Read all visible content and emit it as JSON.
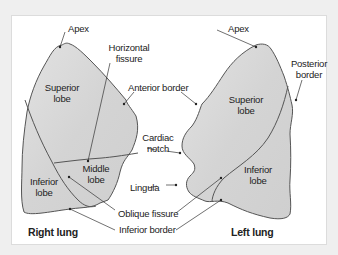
{
  "diagram": {
    "type": "anatomical-illustration",
    "colors": {
      "background": "#efefef",
      "panel": "#ffffff",
      "lung_fill": "#d9d9d9",
      "lung_outline": "#555555",
      "leader_line": "#333333",
      "text": "#222222"
    },
    "right_lung": {
      "title": "Right lung",
      "labels": {
        "apex": "Apex",
        "horizontal_fissure_1": "Horizontal",
        "horizontal_fissure_2": "fissure",
        "superior_lobe_1": "Superior",
        "superior_lobe_2": "lobe",
        "middle_lobe_1": "Middle",
        "middle_lobe_2": "lobe",
        "inferior_lobe_1": "Inferior",
        "inferior_lobe_2": "lobe"
      }
    },
    "left_lung": {
      "title": "Left lung",
      "labels": {
        "apex": "Apex",
        "posterior_border_1": "Posterior",
        "posterior_border_2": "border",
        "superior_lobe_1": "Superior",
        "superior_lobe_2": "lobe",
        "inferior_lobe_1": "Inferior",
        "inferior_lobe_2": "lobe"
      }
    },
    "shared_labels": {
      "anterior_border": "Anterior border",
      "cardiac_notch_1": "Cardiac",
      "cardiac_notch_2": "notch",
      "lingula": "Lingula",
      "oblique_fissure": "Oblique fissure",
      "inferior_border": "Inferior border"
    }
  }
}
